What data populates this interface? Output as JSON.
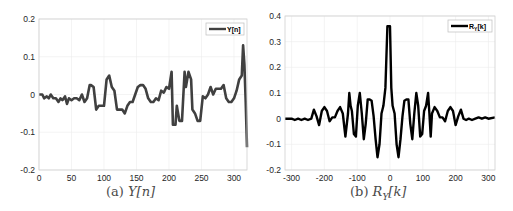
{
  "chart_data": [
    {
      "type": "line",
      "title": "",
      "caption": "(a) Y[n]",
      "caption_prefix": "(a) ",
      "caption_math": "Y[n]",
      "xlabel": "",
      "ylabel": "",
      "xlim": [
        0,
        320
      ],
      "ylim": [
        -0.2,
        0.2
      ],
      "xticks": [
        0,
        50,
        100,
        150,
        200,
        250,
        300
      ],
      "yticks": [
        -0.2,
        -0.1,
        0,
        0.1,
        0.2
      ],
      "ytick_labels": [
        "-0.2",
        "-0.1",
        "0",
        "0.1",
        "0.2"
      ],
      "grid": true,
      "legend_position": "upper right",
      "series": [
        {
          "name": "Y[n]",
          "color": "#404040",
          "x": [
            0,
            5,
            8,
            12,
            15,
            18,
            22,
            26,
            30,
            33,
            36,
            40,
            43,
            46,
            50,
            54,
            58,
            62,
            66,
            70,
            74,
            78,
            80,
            84,
            88,
            92,
            96,
            100,
            104,
            108,
            112,
            116,
            120,
            124,
            128,
            132,
            136,
            140,
            144,
            148,
            152,
            156,
            160,
            164,
            168,
            172,
            176,
            180,
            184,
            188,
            192,
            196,
            200,
            204,
            206,
            210,
            212,
            216,
            220,
            224,
            226,
            230,
            234,
            236,
            240,
            244,
            248,
            252,
            256,
            260,
            264,
            268,
            272,
            276,
            280,
            284,
            288,
            292,
            296,
            300,
            304,
            308,
            312,
            314,
            316,
            318,
            320
          ],
          "y": [
            0,
            0,
            -0.01,
            -0.005,
            -0.01,
            0,
            -0.01,
            -0.01,
            -0.02,
            -0.01,
            -0.015,
            -0.005,
            -0.025,
            -0.01,
            -0.015,
            -0.01,
            -0.01,
            -0.015,
            0,
            -0.02,
            -0.01,
            0.025,
            0.025,
            0.02,
            -0.04,
            -0.03,
            -0.03,
            -0.03,
            0.04,
            0.05,
            0.02,
            0.01,
            -0.04,
            -0.04,
            -0.04,
            -0.05,
            -0.03,
            -0.02,
            -0.02,
            0,
            0.02,
            0.025,
            0.025,
            0.015,
            -0.01,
            -0.02,
            -0.02,
            -0.01,
            -0.015,
            0.01,
            0.005,
            0.02,
            0.015,
            0.06,
            -0.08,
            -0.08,
            -0.03,
            -0.07,
            -0.07,
            0.06,
            0.02,
            0.06,
            0.04,
            -0.04,
            -0.05,
            -0.07,
            -0.07,
            -0.005,
            -0.01,
            0,
            0.02,
            0,
            0.015,
            0.015,
            0.015,
            0.025,
            -0.01,
            -0.02,
            -0.02,
            -0.01,
            0.01,
            0.04,
            0.05,
            0.13,
            0.08,
            -0.02,
            -0.14
          ]
        }
      ]
    },
    {
      "type": "line",
      "title": "",
      "caption": "(b) R_Y[k]",
      "caption_prefix": "(b) ",
      "caption_math": "R",
      "caption_sub": "Y",
      "caption_math_suffix": "[k]",
      "xlabel": "",
      "ylabel": "",
      "xlim": [
        -320,
        320
      ],
      "ylim": [
        -0.2,
        0.4
      ],
      "xticks": [
        -300,
        -200,
        -100,
        0,
        100,
        200,
        300
      ],
      "yticks": [
        -0.2,
        -0.1,
        0,
        0.1,
        0.2,
        0.3,
        0.4
      ],
      "ytick_labels": [
        "-0.2",
        "-0.1",
        "0",
        "0.1",
        "0.2",
        "0.3",
        "0.4"
      ],
      "grid": true,
      "legend_position": "upper right",
      "series": [
        {
          "name": "R_Y[k]",
          "legend_main": "R",
          "legend_sub": "Y",
          "legend_suffix": "[k]",
          "color": "#000000",
          "x": [
            -320,
            -300,
            -290,
            -280,
            -270,
            -260,
            -250,
            -240,
            -232,
            -224,
            -216,
            -208,
            -200,
            -192,
            -184,
            -176,
            -168,
            -160,
            -152,
            -144,
            -136,
            -128,
            -124,
            -120,
            -116,
            -110,
            -104,
            -98,
            -92,
            -86,
            -80,
            -74,
            -68,
            -62,
            -56,
            -50,
            -44,
            -38,
            -32,
            -26,
            -20,
            -14,
            -8,
            -4,
            0,
            4,
            8,
            14,
            20,
            26,
            32,
            38,
            44,
            50,
            56,
            62,
            68,
            74,
            80,
            86,
            92,
            98,
            104,
            110,
            116,
            120,
            124,
            128,
            136,
            144,
            152,
            160,
            168,
            176,
            184,
            192,
            200,
            208,
            216,
            224,
            232,
            240,
            250,
            260,
            270,
            280,
            290,
            300,
            320
          ],
          "y": [
            0,
            0,
            -0.005,
            0,
            -0.005,
            0,
            -0.005,
            0,
            0.035,
            0.01,
            -0.025,
            0.03,
            0.045,
            0.03,
            -0.01,
            0.005,
            0.005,
            0.03,
            0.045,
            0.02,
            -0.07,
            0.02,
            0.1,
            0.05,
            0.03,
            -0.06,
            -0.07,
            0.05,
            0.1,
            0.02,
            -0.08,
            -0.02,
            0.075,
            0.075,
            0.07,
            0.01,
            -0.08,
            -0.15,
            -0.1,
            0.02,
            0.05,
            0.12,
            0.36,
            0.36,
            0.36,
            0.12,
            0.05,
            0.02,
            -0.1,
            -0.15,
            -0.08,
            0.01,
            0.07,
            0.075,
            0.075,
            -0.02,
            -0.08,
            0.02,
            0.1,
            0.05,
            -0.07,
            -0.06,
            0.03,
            0.05,
            0.1,
            0.02,
            -0.07,
            0.02,
            0.045,
            0.03,
            0.005,
            0.005,
            -0.01,
            0.03,
            0.045,
            0.03,
            -0.025,
            0.01,
            0.035,
            0,
            -0.005,
            0,
            -0.005,
            0,
            0.005,
            0,
            0.005,
            0,
            0.005
          ]
        }
      ]
    }
  ]
}
